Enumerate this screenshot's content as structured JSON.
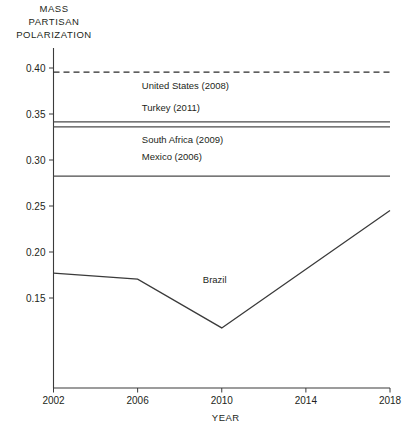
{
  "chart_data": {
    "type": "line",
    "title": "",
    "ylabel": "MASS PARTISAN POLARIZATION",
    "xlabel": "YEAR",
    "xlim": [
      2002,
      2018
    ],
    "ylim": [
      0.108,
      0.408
    ],
    "grid": false,
    "legend": "inline-labels",
    "xticks": [
      "2002",
      "2006",
      "2010",
      "2014",
      "2018"
    ],
    "xtick_values": [
      2002,
      2006,
      2010,
      2014,
      2018
    ],
    "yticks": [
      "0.15",
      "0.20",
      "0.25",
      "0.30",
      "0.35",
      "0.40"
    ],
    "ytick_values": [
      0.15,
      0.2,
      0.25,
      0.3,
      0.35,
      0.4
    ],
    "series": [
      {
        "name": "United States (2008)",
        "style": "dashed",
        "kind": "reference-line",
        "value": 0.3955,
        "x": [
          2002,
          2018
        ],
        "values": [
          0.3955,
          0.3955
        ],
        "label": "United States (2008)",
        "label_x": 2006.2,
        "label_y": 0.3775
      },
      {
        "name": "Turkey (2011)",
        "style": "solid",
        "kind": "reference-line",
        "value": 0.3415,
        "x": [
          2002,
          2018
        ],
        "values": [
          0.3415,
          0.3415
        ],
        "label": "Turkey (2011)",
        "label_x": 2006.2,
        "label_y": 0.3535
      },
      {
        "name": "South Africa (2009)",
        "style": "solid",
        "kind": "reference-line",
        "value": 0.336,
        "x": [
          2002,
          2018
        ],
        "values": [
          0.336,
          0.336
        ],
        "label": "South Africa (2009)",
        "label_x": 2006.2,
        "label_y": 0.3185
      },
      {
        "name": "Mexico (2006)",
        "style": "solid",
        "kind": "reference-line",
        "value": 0.2825,
        "x": [
          2002,
          2018
        ],
        "values": [
          0.2825,
          0.2825
        ],
        "label": "Mexico (2006)",
        "label_x": 2006.2,
        "label_y": 0.2995
      },
      {
        "name": "Brazil",
        "style": "solid",
        "kind": "trend-line",
        "x": [
          2002,
          2006,
          2010,
          2018
        ],
        "values": [
          0.177,
          0.1705,
          0.1175,
          0.245
        ],
        "label": "Brazil",
        "label_x": 2009.1,
        "label_y": 0.1665
      }
    ]
  },
  "axis": {
    "y_title_lines": [
      "MASS",
      "PARTISAN",
      "POLARIZATION"
    ],
    "x_title": "YEAR"
  }
}
